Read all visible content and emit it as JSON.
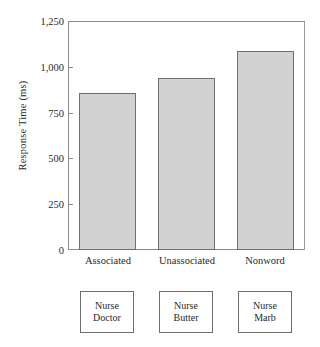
{
  "chart_data": {
    "type": "bar",
    "title": "",
    "xlabel": "",
    "ylabel": "Response Time (ms)",
    "categories": [
      "Associated",
      "Unassociated",
      "Nonword"
    ],
    "values": [
      857,
      939,
      1086
    ],
    "series": [
      {
        "name": "Response Time",
        "values": [
          857,
          939,
          1086
        ]
      }
    ],
    "ylim": [
      0,
      1250
    ],
    "yticks": [
      0,
      250,
      500,
      750,
      1000,
      1250
    ],
    "ytick_labels": [
      "0",
      "250",
      "500",
      "750",
      "1,000",
      "1,250"
    ],
    "grid": false,
    "legend": false,
    "bar_fill_color": "#d2d2d2",
    "bar_edge_color": "#6e6e6e",
    "axis_color": "#8c8c8c"
  },
  "axis": {
    "y_title": "Response Time (ms)",
    "ticks": [
      {
        "label": "1,250",
        "value": 1250
      },
      {
        "label": "1,000",
        "value": 1000
      },
      {
        "label": "750",
        "value": 750
      },
      {
        "label": "500",
        "value": 500
      },
      {
        "label": "250",
        "value": 250
      },
      {
        "label": "0",
        "value": 0
      }
    ]
  },
  "categories": [
    {
      "label": "Associated"
    },
    {
      "label": "Unassociated"
    },
    {
      "label": "Nonword"
    }
  ],
  "stimuli": [
    {
      "prime": "Nurse",
      "target": "Doctor"
    },
    {
      "prime": "Nurse",
      "target": "Butter"
    },
    {
      "prime": "Nurse",
      "target": "Marb"
    }
  ]
}
